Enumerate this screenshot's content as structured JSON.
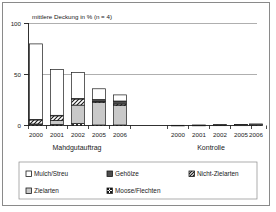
{
  "chart_data": {
    "type": "bar",
    "title": "mittlere Deckung in % (n = 4)",
    "subtitle": "",
    "xlabel": "",
    "ylabel": "",
    "ylim": [
      0,
      100
    ],
    "yticks": [
      0,
      50,
      100
    ],
    "ytick_labels": [
      "0",
      "50",
      "100"
    ],
    "grid": true,
    "stacked": true,
    "legend_position": "bottom",
    "groups": [
      {
        "name": "Mahdgutauftrag",
        "categories": [
          "2000",
          "2001",
          "2002",
          "2005",
          "2006"
        ]
      },
      {
        "name": "Kontrolle",
        "categories": [
          "2000",
          "2001",
          "2002",
          "2005",
          "2006"
        ]
      }
    ],
    "categories": [
      "2000",
      "2001",
      "2002",
      "2005",
      "2006",
      "2000",
      "2001",
      "2002",
      "2005",
      "2006"
    ],
    "series": [
      {
        "name": "Moose/Flechten",
        "pattern": "crosshatch",
        "color": "#ffffff",
        "values": [
          1.0,
          1.0,
          2.0,
          0.5,
          0.5,
          0.0,
          0.0,
          0.0,
          0.0,
          0.0
        ]
      },
      {
        "name": "Zielarten",
        "pattern": "lightgray",
        "color": "#c9c9c9",
        "values": [
          0.5,
          4.0,
          18.0,
          22.0,
          19.0,
          0.2,
          0.3,
          0.4,
          0.4,
          0.6
        ]
      },
      {
        "name": "Nicht-Zielarten",
        "pattern": "diagonal-hatch",
        "color": "#ffffff",
        "values": [
          4.0,
          4.5,
          6.0,
          1.0,
          1.5,
          0.0,
          0.0,
          0.2,
          0.2,
          0.3
        ]
      },
      {
        "name": "Gehölze",
        "pattern": "darkgray",
        "color": "#4d4d4d",
        "values": [
          0.5,
          0.5,
          0.5,
          2.0,
          3.0,
          0.0,
          0.1,
          0.1,
          0.2,
          0.3
        ]
      },
      {
        "name": "Mulch/Streu",
        "pattern": "white",
        "color": "#ffffff",
        "values": [
          74.0,
          45.0,
          25.5,
          10.5,
          6.0,
          0.0,
          0.0,
          0.0,
          0.1,
          0.3
        ]
      }
    ],
    "totals": [
      80.0,
      55.0,
      52.0,
      36.0,
      30.0,
      0.2,
      0.4,
      0.7,
      0.9,
      1.5
    ]
  },
  "legend": {
    "items": [
      {
        "label": "Mulch/Streu"
      },
      {
        "label": "Gehölze"
      },
      {
        "label": "Nicht-Zielarten"
      },
      {
        "label": "Zielarten"
      },
      {
        "label": "Moose/Flechten"
      }
    ]
  }
}
